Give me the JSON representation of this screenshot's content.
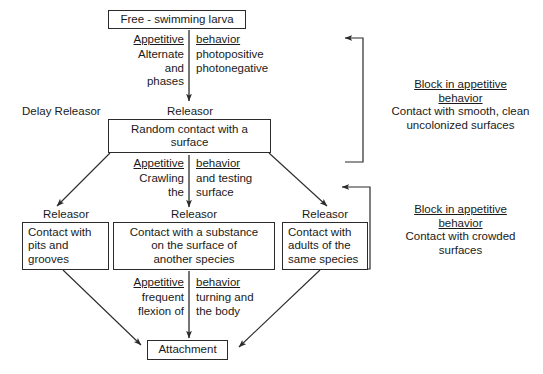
{
  "diagram": {
    "boxes": {
      "larva": "Free - swimming larva",
      "random_contact": "Random contact with a\nsurface",
      "pits": "Contact with\npits and\ngrooves",
      "substance": "Contact with a substance\non the surface of\nanother species",
      "adults": "Contact with\nadults of the\nsame species",
      "attachment": "Attachment"
    },
    "stage1": {
      "appetitive": "Appetitive",
      "behavior": "behavior",
      "left_text": "Alternate\nand\nphases",
      "right_text": "photopositive\nphotonegative"
    },
    "stage2": {
      "appetitive": "Appetitive",
      "behavior": "behavior",
      "left_text": "Crawling\nthe",
      "right_text": "and testing\nsurface"
    },
    "stage3": {
      "appetitive": "Appetitive",
      "behavior": "behavior",
      "left_text": "frequent\nflexion of",
      "right_text": "turning and\nthe  body"
    },
    "releasers": {
      "delay": "Delay Releasor",
      "r_random": "Releasor",
      "r_pits": "Releasor",
      "r_substance": "Releasor",
      "r_adults": "Releasor"
    },
    "blocks": [
      {
        "heading": "Block in appetitive\nbehavior",
        "text": "Contact with smooth, clean\nuncolonized surfaces"
      },
      {
        "heading": "Block in appetitive\nbehavior",
        "text": "Contact with crowded\nsurfaces"
      }
    ],
    "colors": {
      "stroke": "#2b2b2b",
      "text": "#1a1a1a",
      "background": "#ffffff"
    }
  }
}
